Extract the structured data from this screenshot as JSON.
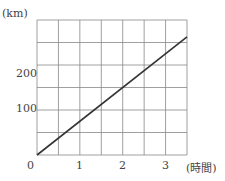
{
  "chart_data": {
    "type": "line",
    "title": "",
    "xlabel": "(時間)",
    "ylabel": "(km)",
    "x_ticks": [
      "0",
      "1",
      "2",
      "3"
    ],
    "y_ticks": [
      "100",
      "200"
    ],
    "origin_label": "0",
    "xlim": [
      0,
      3.5
    ],
    "ylim": [
      0,
      300
    ],
    "grid": true,
    "grid_x_step": 0.5,
    "grid_y_step": 50,
    "series": [
      {
        "name": "distance",
        "x": [
          0,
          3.5
        ],
        "y": [
          0,
          262.5
        ]
      }
    ]
  }
}
